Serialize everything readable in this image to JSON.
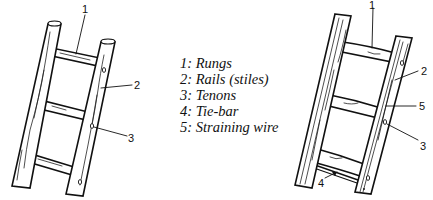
{
  "figure": {
    "left_ladder": {
      "description": "Rung ladder with round rungs tenoned into rails",
      "callouts": [
        {
          "number": "1",
          "target": "rung"
        },
        {
          "number": "2",
          "target": "rail"
        },
        {
          "number": "3",
          "target": "tenon"
        }
      ]
    },
    "right_ladder": {
      "description": "Ladder with tie-bar and straining wire",
      "callouts": [
        {
          "number": "1",
          "target": "rung"
        },
        {
          "number": "2",
          "target": "rail"
        },
        {
          "number": "5",
          "target": "straining wire"
        },
        {
          "number": "3",
          "target": "tenon"
        },
        {
          "number": "4",
          "target": "tie-bar"
        }
      ]
    }
  },
  "legend": {
    "items": [
      {
        "label": "1: Rungs"
      },
      {
        "label": "2: Rails (stiles)"
      },
      {
        "label": "3: Tenons"
      },
      {
        "label": "4: Tie-bar"
      },
      {
        "label": "5: Straining wire"
      }
    ]
  },
  "colors": {
    "ink": "#111111",
    "background": "#ffffff"
  }
}
